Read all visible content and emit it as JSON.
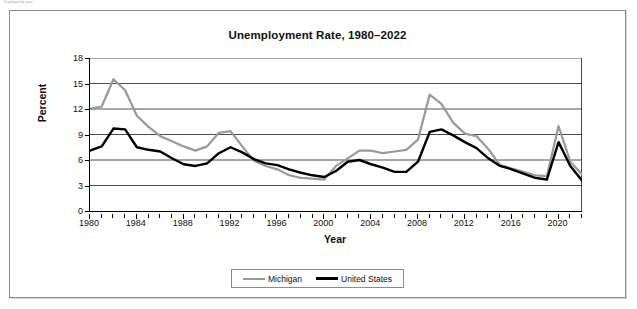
{
  "page": {
    "header_fragment": "Displayed by year"
  },
  "chart": {
    "title": "Unemployment Rate, 1980–2022",
    "x_axis_title": "Year",
    "y_axis_title": "Percent",
    "legend": [
      {
        "label": "Michigan",
        "color": "#999999"
      },
      {
        "label": "United States",
        "color": "#000000"
      }
    ]
  },
  "chart_data": {
    "type": "line",
    "title": "Unemployment Rate, 1980–2022",
    "xlabel": "Year",
    "ylabel": "Percent",
    "xlim": [
      1980,
      2022
    ],
    "ylim": [
      0,
      18
    ],
    "yticks": [
      0,
      3,
      6,
      9,
      12,
      15,
      18
    ],
    "xticks": [
      1980,
      1984,
      1988,
      1992,
      1996,
      2000,
      2004,
      2008,
      2012,
      2016,
      2020
    ],
    "xtick_interval": 4,
    "grid": "horizontal",
    "legend_position": "bottom",
    "x": [
      1980,
      1981,
      1982,
      1983,
      1984,
      1985,
      1986,
      1987,
      1988,
      1989,
      1990,
      1991,
      1992,
      1993,
      1994,
      1995,
      1996,
      1997,
      1998,
      1999,
      2000,
      2001,
      2002,
      2003,
      2004,
      2005,
      2006,
      2007,
      2008,
      2009,
      2010,
      2011,
      2012,
      2013,
      2014,
      2015,
      2016,
      2017,
      2018,
      2019,
      2020,
      2021,
      2022
    ],
    "series": [
      {
        "name": "Michigan",
        "color": "#999999",
        "values": [
          12.0,
          12.3,
          15.5,
          14.2,
          11.2,
          9.9,
          8.8,
          8.2,
          7.6,
          7.1,
          7.6,
          9.2,
          9.4,
          7.6,
          5.9,
          5.3,
          4.9,
          4.2,
          3.9,
          3.8,
          3.7,
          5.3,
          6.2,
          7.1,
          7.1,
          6.8,
          7.0,
          7.2,
          8.4,
          13.7,
          12.6,
          10.4,
          9.1,
          8.8,
          7.3,
          5.4,
          5.0,
          4.6,
          4.2,
          4.1,
          10.0,
          5.8,
          4.3
        ]
      },
      {
        "name": "United States",
        "color": "#000000",
        "values": [
          7.1,
          7.6,
          9.7,
          9.6,
          7.5,
          7.2,
          7.0,
          6.2,
          5.5,
          5.3,
          5.6,
          6.8,
          7.5,
          6.9,
          6.1,
          5.6,
          5.4,
          4.9,
          4.5,
          4.2,
          4.0,
          4.7,
          5.8,
          6.0,
          5.5,
          5.1,
          4.6,
          4.6,
          5.8,
          9.3,
          9.6,
          8.9,
          8.1,
          7.4,
          6.2,
          5.3,
          4.9,
          4.4,
          3.9,
          3.7,
          8.1,
          5.3,
          3.6
        ]
      }
    ]
  }
}
